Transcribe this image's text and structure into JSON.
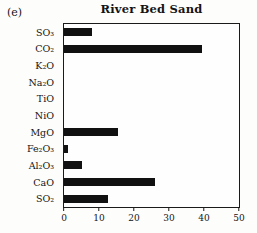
{
  "panel_label": "(e)",
  "chart_data": {
    "type": "bar",
    "orientation": "horizontal",
    "title": "River Bed Sand",
    "categories": [
      "SO₃",
      "CO₂",
      "K₂O",
      "Na₂O",
      "TiO",
      "NiO",
      "MgO",
      "Fe₂O₃",
      "Al₂O₃",
      "CaO",
      "SO₂"
    ],
    "values": [
      8,
      39.5,
      0,
      0,
      0,
      0,
      15.5,
      1,
      5,
      26,
      12.5
    ],
    "xlabel": "",
    "ylabel": "",
    "xlim": [
      0,
      50
    ],
    "xticks": [
      "0",
      "10",
      "20",
      "30",
      "40",
      "50"
    ],
    "grid": false,
    "legend": false,
    "bar_color": "#111111",
    "frame_color": "#1a1a1a",
    "background_color": "#fdfdfc"
  }
}
